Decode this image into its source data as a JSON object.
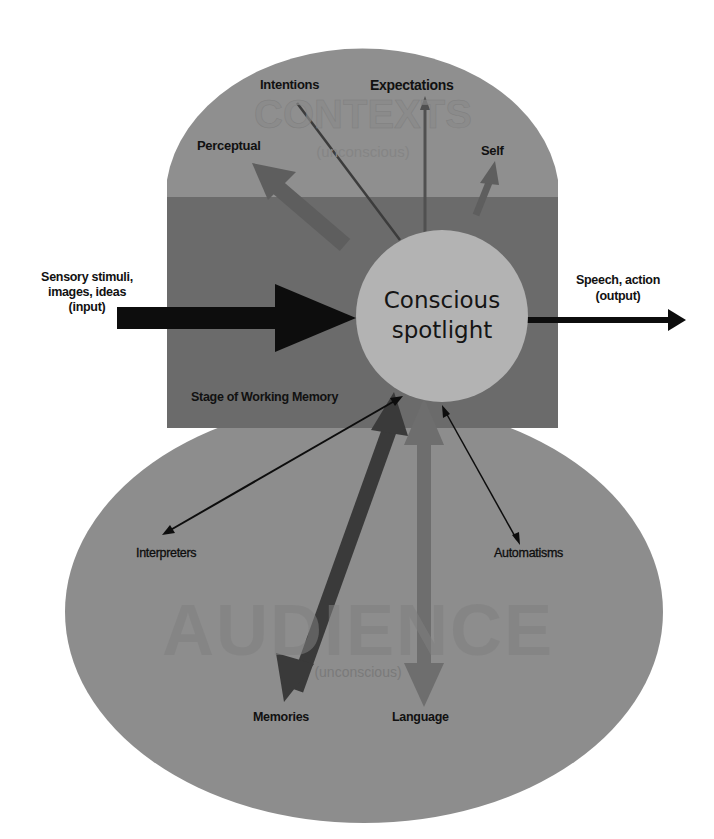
{
  "diagram": {
    "regions": {
      "contexts": {
        "title": "CONTEXTS",
        "subtitle": "(unconscious)",
        "color": "#8f8f8f"
      },
      "stage": {
        "label": "Stage of Working Memory",
        "color": "#6b6b6b"
      },
      "spotlight": {
        "line1": "Conscious",
        "line2": "spotlight",
        "color": "#b3b3b3"
      },
      "audience": {
        "title": "AUDIENCE",
        "subtitle": "(unconscious)",
        "color": "#8d8d8d"
      }
    },
    "context_labels": {
      "perceptual": "Perceptual",
      "intentions": "Intentions",
      "expectations": "Expectations",
      "self": "Self"
    },
    "io": {
      "input_line1": "Sensory stimuli,",
      "input_line2": "images, ideas",
      "input_line3": "(input)",
      "output_line1": "Speech, action",
      "output_line2": "(output)"
    },
    "audience_labels": {
      "interpreters": "Interpreters",
      "automatisms": "Automatisms",
      "memories": "Memories",
      "language": "Language"
    },
    "arrow_colors": {
      "black": "#0d0d0d",
      "dark": "#3a3a3a",
      "mid": "#6e6e6e",
      "perceptual": "#5e5e5e"
    }
  }
}
